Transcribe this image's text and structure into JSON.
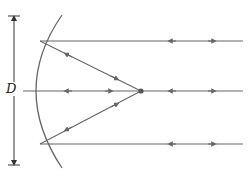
{
  "diagram": {
    "title": "",
    "labels": {
      "aperture": "D"
    },
    "colors": {
      "stroke": "#666666",
      "text": "#222222",
      "background": "#ffffff"
    },
    "elements": [
      "curved-mirror",
      "aperture-dimension-D",
      "horizontal-ray-top",
      "horizontal-ray-middle",
      "horizontal-ray-bottom",
      "reflected-ray-top-to-focus",
      "reflected-ray-bottom-to-focus",
      "focal-point"
    ],
    "arrow_direction_note": "Each ray carries a pair of arrow markers; their direction was not resolvable from the screenshot and is inferred."
  }
}
